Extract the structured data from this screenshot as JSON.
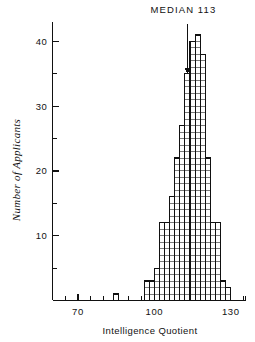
{
  "chart_data": {
    "type": "bar",
    "title": "",
    "xlabel": "Intelligence Quotient",
    "ylabel": "Number of Applicants",
    "xlim": [
      60,
      136
    ],
    "ylim": [
      0,
      43
    ],
    "x_ticks_major": [
      70,
      100,
      130
    ],
    "x_ticks_major_labels": [
      "70",
      "130",
      "100"
    ],
    "x_ticks_minor": [
      65,
      75,
      80,
      85,
      90,
      95,
      105,
      110,
      115,
      120,
      125,
      135
    ],
    "y_ticks_major": [
      10,
      20,
      30,
      40
    ],
    "y_ticks_major_labels": [
      "10",
      "20",
      "30",
      "40"
    ],
    "y_ticks_minor": [
      5,
      15,
      25,
      35
    ],
    "grid": false,
    "legend": false,
    "bin_width": 2,
    "cell_style": "unit-square-tally",
    "categories": [
      "84",
      "86",
      "96",
      "98",
      "100",
      "102",
      "104",
      "106",
      "108",
      "110",
      "112",
      "114",
      "116",
      "118",
      "120",
      "122",
      "124",
      "126",
      "128"
    ],
    "values": [
      1,
      0,
      3,
      3,
      5,
      12,
      12,
      16,
      22,
      27,
      35,
      40,
      41,
      38,
      22,
      12,
      12,
      3,
      2
    ],
    "annotations": [
      {
        "label": "MEDIAN 113",
        "x": 113,
        "y_text": 41,
        "arrow_to_y": 35
      }
    ]
  },
  "axes": {
    "x_title": "Intelligence Quotient",
    "y_title": "Number of Applicants",
    "x_tick_labels": [
      {
        "value": 70,
        "text": "70"
      },
      {
        "value": 100,
        "text": "100"
      },
      {
        "value": 130,
        "text": "130"
      }
    ],
    "y_tick_labels": [
      {
        "value": 10,
        "text": "10"
      },
      {
        "value": 20,
        "text": "20"
      },
      {
        "value": 30,
        "text": "30"
      },
      {
        "value": 40,
        "text": "40"
      }
    ]
  },
  "annotation": {
    "median_label": "MEDIAN 113"
  },
  "colors": {
    "ink": "#111111",
    "background": "#ffffff"
  }
}
